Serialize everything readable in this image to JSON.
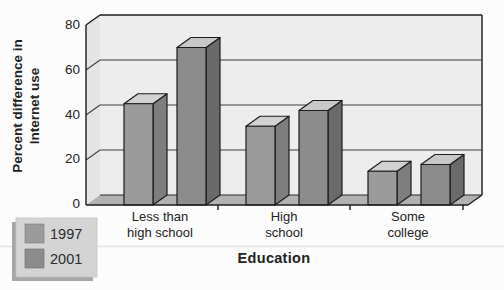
{
  "chart_data": {
    "type": "bar",
    "style_3d": true,
    "title": "",
    "xlabel": "Education",
    "ylabel": "Percent difference in Internet use",
    "ylabel_lines": [
      "Percent difference in",
      "Internet use"
    ],
    "categories": [
      "Less than high school",
      "High school",
      "Some college"
    ],
    "category_label_lines": [
      [
        "Less than",
        "high school"
      ],
      [
        "High",
        "school"
      ],
      [
        "Some",
        "college"
      ]
    ],
    "series": [
      {
        "name": "1997",
        "values": [
          45,
          35,
          15
        ]
      },
      {
        "name": "2001",
        "values": [
          70,
          42,
          18
        ]
      }
    ],
    "yticks": [
      0,
      20,
      40,
      60,
      80
    ],
    "ylim": [
      0,
      80
    ],
    "grid": true,
    "legend_position": "bottom-left"
  },
  "colors": {
    "series": [
      {
        "front": "#9b9b9b",
        "top": "#d2d2d2",
        "side": "#7e7e7e"
      },
      {
        "front": "#8c8c8c",
        "top": "#c8c8c8",
        "side": "#6a6a6a"
      }
    ],
    "back_wall": "#ededed",
    "side_wall": "#e4e4e4",
    "floor": "#b2b2b2",
    "outline": "#1c1c1c",
    "gridline": "#3f3f3f",
    "legend_box": "#d4d4d4",
    "legend_shadow": "#a6a6a6",
    "page_rule": "#e3e3e3"
  }
}
